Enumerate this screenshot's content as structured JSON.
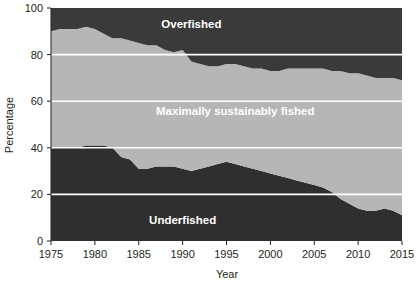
{
  "chart_data": {
    "type": "area",
    "title": "",
    "subtitle": "",
    "xlabel": "Year",
    "ylabel": "Percentage",
    "xlim": [
      1975,
      2015
    ],
    "ylim": [
      0,
      100
    ],
    "xticks": [
      1975,
      1980,
      1985,
      1990,
      1995,
      2000,
      2005,
      2010,
      2015
    ],
    "yticks": [
      0,
      20,
      40,
      60,
      80,
      100
    ],
    "grid": "horizontal-white",
    "legend_position": "inline-labels",
    "stacked": true,
    "stack_total": 100,
    "x": [
      1975,
      1976,
      1977,
      1978,
      1979,
      1980,
      1981,
      1982,
      1983,
      1984,
      1985,
      1986,
      1987,
      1988,
      1989,
      1990,
      1991,
      1992,
      1993,
      1994,
      1995,
      1996,
      1997,
      1998,
      1999,
      2000,
      2001,
      2002,
      2003,
      2004,
      2005,
      2006,
      2007,
      2008,
      2009,
      2010,
      2011,
      2012,
      2013,
      2014,
      2015
    ],
    "series": [
      {
        "name": "Underfished",
        "color": "#2f2f2f",
        "values": [
          40,
          40,
          40,
          40,
          41,
          41,
          41,
          40,
          36,
          35,
          31,
          31,
          32,
          32,
          32,
          31,
          30,
          31,
          32,
          33,
          34,
          33,
          32,
          31,
          30,
          29,
          28,
          27,
          26,
          25,
          24,
          23,
          21,
          18,
          16,
          14,
          13,
          13,
          14,
          13,
          11
        ]
      },
      {
        "name": "Maximally sustainably fished",
        "color": "#b6b6b6",
        "values": [
          50,
          51,
          51,
          51,
          51,
          50,
          48,
          47,
          51,
          51,
          54,
          53,
          52,
          50,
          49,
          51,
          47,
          45,
          43,
          42,
          42,
          43,
          43,
          43,
          44,
          44,
          45,
          47,
          48,
          49,
          50,
          51,
          52,
          55,
          56,
          58,
          58,
          57,
          56,
          57,
          58
        ]
      },
      {
        "name": "Overfished",
        "color": "#3a3a3a",
        "values": [
          10,
          9,
          9,
          9,
          8,
          9,
          11,
          13,
          13,
          14,
          15,
          16,
          16,
          18,
          19,
          18,
          23,
          24,
          25,
          25,
          24,
          24,
          25,
          26,
          26,
          27,
          27,
          26,
          26,
          26,
          26,
          26,
          27,
          27,
          28,
          28,
          29,
          30,
          30,
          30,
          31
        ]
      }
    ],
    "boundaries": {
      "underfished_top": [
        40,
        40,
        40,
        40,
        41,
        41,
        41,
        40,
        36,
        35,
        31,
        31,
        32,
        32,
        32,
        31,
        30,
        31,
        32,
        33,
        34,
        33,
        32,
        31,
        30,
        29,
        28,
        27,
        26,
        25,
        24,
        23,
        21,
        18,
        16,
        14,
        13,
        13,
        14,
        13,
        11
      ],
      "overfished_bottom": [
        90,
        91,
        91,
        91,
        92,
        91,
        89,
        87,
        87,
        86,
        85,
        84,
        84,
        82,
        81,
        82,
        77,
        76,
        75,
        75,
        76,
        76,
        75,
        74,
        74,
        73,
        73,
        74,
        74,
        74,
        74,
        74,
        73,
        73,
        72,
        72,
        71,
        70,
        70,
        70,
        69
      ]
    },
    "band_labels": [
      {
        "text": "Overfished",
        "x": 1991,
        "y": 93
      },
      {
        "text": "Maximally sustainably fished",
        "x": 1996,
        "y": 56
      },
      {
        "text": "Underfished",
        "x": 1990,
        "y": 9
      }
    ]
  },
  "axes": {
    "y_title": "Percentage",
    "x_title": "Year",
    "x_tick_labels": [
      "1975",
      "1980",
      "1985",
      "1990",
      "1995",
      "2000",
      "2005",
      "2010",
      "2015"
    ],
    "y_tick_labels": [
      "0",
      "20",
      "40",
      "60",
      "80",
      "100"
    ]
  },
  "colors": {
    "underfished": "#2f2f2f",
    "maximally": "#b6b6b6",
    "overfished": "#3a3a3a",
    "gridline": "#ffffff",
    "axis": "#231f20",
    "background": "#ffffff",
    "label_text": "#ffffff"
  }
}
